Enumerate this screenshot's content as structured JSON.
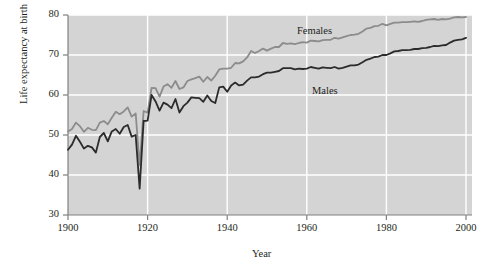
{
  "chart_data": {
    "type": "line",
    "title": "",
    "xlabel": "Year",
    "ylabel": "Life expectancy at birth",
    "xlim": [
      1900,
      2002
    ],
    "ylim": [
      30,
      80
    ],
    "xticks": [
      1900,
      1920,
      1940,
      1960,
      1980,
      2000
    ],
    "xtick_labels": [
      "1900",
      "1920",
      "1940",
      "1960",
      "1980",
      "2000"
    ],
    "yticks": [
      30,
      40,
      50,
      60,
      70,
      80
    ],
    "ytick_labels": [
      "30",
      "40",
      "50",
      "60",
      "70",
      "80"
    ],
    "grid": "white gridlines on grey panel, horizontal at every y tick and vertical at every x tick",
    "legend_position": "inline annotations on curves",
    "panel_color": "#d4d4d4",
    "grid_color": "#ffffff",
    "axis_color": "#808080",
    "x": [
      1900,
      1901,
      1902,
      1903,
      1904,
      1905,
      1906,
      1907,
      1908,
      1909,
      1910,
      1911,
      1912,
      1913,
      1914,
      1915,
      1916,
      1917,
      1918,
      1919,
      1920,
      1921,
      1922,
      1923,
      1924,
      1925,
      1926,
      1927,
      1928,
      1929,
      1930,
      1931,
      1932,
      1933,
      1934,
      1935,
      1936,
      1937,
      1938,
      1939,
      1940,
      1941,
      1942,
      1943,
      1944,
      1945,
      1946,
      1947,
      1948,
      1949,
      1950,
      1951,
      1952,
      1953,
      1954,
      1955,
      1956,
      1957,
      1958,
      1959,
      1960,
      1961,
      1962,
      1963,
      1964,
      1965,
      1966,
      1967,
      1968,
      1969,
      1970,
      1971,
      1972,
      1973,
      1974,
      1975,
      1976,
      1977,
      1978,
      1979,
      1980,
      1981,
      1982,
      1983,
      1984,
      1985,
      1986,
      1987,
      1988,
      1989,
      1990,
      1991,
      1992,
      1993,
      1994,
      1995,
      1996,
      1997,
      1998,
      1999,
      2000
    ],
    "series": [
      {
        "name": "Females",
        "color": "#8c8c8c",
        "label": "Females",
        "values": [
          50.9,
          51.5,
          53.1,
          52.2,
          50.8,
          51.8,
          51.3,
          51.2,
          53.1,
          53.5,
          52.7,
          54.3,
          55.8,
          55.2,
          55.9,
          56.9,
          54.6,
          55.4,
          42.5,
          56.0,
          55.6,
          61.8,
          61.7,
          59.6,
          62.1,
          62.7,
          61.8,
          63.5,
          61.5,
          61.9,
          63.5,
          63.9,
          64.2,
          64.6,
          63.3,
          64.5,
          63.6,
          64.8,
          66.4,
          66.6,
          66.6,
          66.8,
          68.0,
          67.9,
          68.4,
          69.4,
          71.0,
          70.5,
          71.0,
          71.6,
          71.1,
          71.6,
          72.0,
          72.0,
          73.0,
          72.8,
          72.9,
          72.7,
          73.0,
          73.2,
          73.1,
          73.6,
          73.5,
          73.4,
          73.7,
          73.8,
          73.8,
          74.3,
          74.1,
          74.4,
          74.7,
          75.0,
          75.1,
          75.3,
          75.9,
          76.6,
          76.8,
          77.2,
          77.3,
          77.8,
          77.4,
          77.8,
          78.1,
          78.1,
          78.2,
          78.2,
          78.3,
          78.4,
          78.3,
          78.5,
          78.8,
          78.9,
          79.0,
          78.8,
          79.0,
          78.9,
          79.1,
          79.4,
          79.5,
          79.4,
          79.5
        ]
      },
      {
        "name": "Males",
        "color": "#2b2b2b",
        "label": "Males",
        "values": [
          46.3,
          47.6,
          49.8,
          48.3,
          46.6,
          47.3,
          46.9,
          45.6,
          49.5,
          50.5,
          48.4,
          50.9,
          51.5,
          50.3,
          52.0,
          52.5,
          49.6,
          50.0,
          36.6,
          53.5,
          53.6,
          60.0,
          58.4,
          56.1,
          58.1,
          57.6,
          56.7,
          59.0,
          55.6,
          57.2,
          58.1,
          59.4,
          59.3,
          59.2,
          58.3,
          59.9,
          58.5,
          58.0,
          61.9,
          62.1,
          60.8,
          62.4,
          63.1,
          62.4,
          62.6,
          63.6,
          64.4,
          64.4,
          64.6,
          65.2,
          65.6,
          65.6,
          65.8,
          66.0,
          66.7,
          66.7,
          66.7,
          66.4,
          66.6,
          66.5,
          66.6,
          67.0,
          66.8,
          66.6,
          66.9,
          66.8,
          66.7,
          67.0,
          66.6,
          66.8,
          67.1,
          67.4,
          67.4,
          67.6,
          68.2,
          68.8,
          69.1,
          69.5,
          69.6,
          70.0,
          70.0,
          70.4,
          70.9,
          71.0,
          71.2,
          71.2,
          71.3,
          71.5,
          71.5,
          71.7,
          71.8,
          72.0,
          72.3,
          72.2,
          72.4,
          72.5,
          73.1,
          73.6,
          73.8,
          73.9,
          74.3
        ]
      }
    ]
  }
}
